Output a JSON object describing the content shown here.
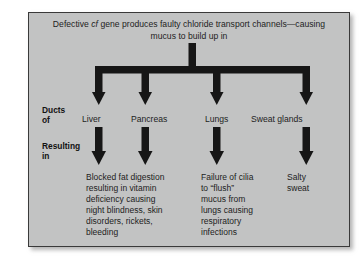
{
  "figure": {
    "header": {
      "text_before_italic": "Defective ",
      "italic_term": "cf",
      "text_after_italic": " gene produces faulty chloride transport channels—causing mucus to build up in"
    },
    "row_labels": [
      {
        "name": "ducts-of",
        "text": "Ducts\nof"
      },
      {
        "name": "resulting-in",
        "text": "Resulting\nin"
      }
    ],
    "organs": [
      {
        "name": "liver",
        "label": "Liver"
      },
      {
        "name": "pancreas",
        "label": "Pancreas"
      },
      {
        "name": "lungs",
        "label": "Lungs"
      },
      {
        "name": "sweat-glands",
        "label": "Sweat glands"
      }
    ],
    "outcomes": [
      {
        "name": "liver-pancreas-outcome",
        "text": "Blocked fat digestion\nresulting in vitamin\ndeficiency causing\nnight blindness, skin\ndisorders, rickets,\nbleeding"
      },
      {
        "name": "lungs-outcome",
        "text": "Failure of cilia\nto “flush”\nmucus from\nlungs causing\nrespiratory\ninfections"
      },
      {
        "name": "sweat-glands-outcome",
        "text": "Salty\nsweat"
      }
    ],
    "colors": {
      "panel_background": "#c2c3c3",
      "panel_border": "#3a3a3a",
      "arrow_fill": "#161616",
      "text": "#1d1d1d",
      "page_background": "#ffffff"
    }
  }
}
